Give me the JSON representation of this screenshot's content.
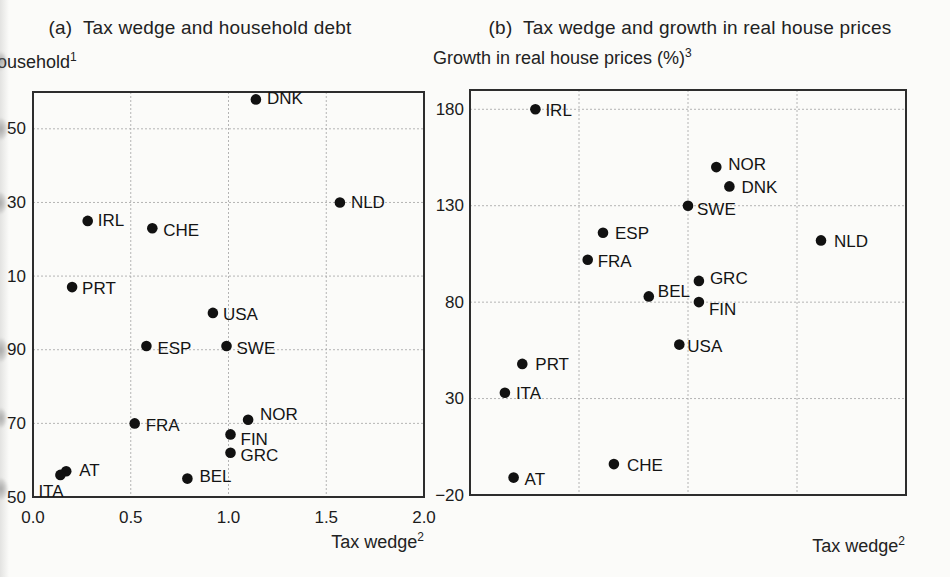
{
  "figure": {
    "background_color": "#fbfbf9",
    "ink_color": "#1c1c1c",
    "grid_color": "#a8a8a8",
    "frame_color": "#2d2d2d",
    "dot_color": "#111111"
  },
  "chart_data": [
    {
      "type": "scatter",
      "panel": "a",
      "title": "(a)  Tax wedge and household debt",
      "ylabel_text": "ousehold",
      "ylabel_sup": "1",
      "xlabel_text": "Tax wedge",
      "xlabel_sup": "2",
      "xlim": [
        0.0,
        2.0
      ],
      "ylim": [
        50,
        160
      ],
      "grid": true,
      "gridlines_x": [
        0.5,
        1.0,
        1.5
      ],
      "gridlines_y": [
        70,
        90,
        110,
        130,
        150
      ],
      "xticks": [
        {
          "value": 0.0,
          "label": "0.0"
        },
        {
          "value": 0.5,
          "label": "0.5"
        },
        {
          "value": 1.0,
          "label": "1.0"
        },
        {
          "value": 1.5,
          "label": "1.5"
        },
        {
          "value": 2.0,
          "label": "2.0"
        }
      ],
      "yticks": [
        {
          "value": 150,
          "label": "50"
        },
        {
          "value": 130,
          "label": "30"
        },
        {
          "value": 110,
          "label": "10"
        },
        {
          "value": 90,
          "label": "90"
        },
        {
          "value": 70,
          "label": "70"
        },
        {
          "value": 50,
          "label": "50"
        }
      ],
      "points": [
        {
          "label": "DNK",
          "x": 1.14,
          "y": 158
        },
        {
          "label": "NLD",
          "x": 1.57,
          "y": 130
        },
        {
          "label": "IRL",
          "x": 0.28,
          "y": 125
        },
        {
          "label": "CHE",
          "x": 0.61,
          "y": 123
        },
        {
          "label": "PRT",
          "x": 0.2,
          "y": 107
        },
        {
          "label": "USA",
          "x": 0.92,
          "y": 100
        },
        {
          "label": "ESP",
          "x": 0.58,
          "y": 91
        },
        {
          "label": "SWE",
          "x": 0.99,
          "y": 91
        },
        {
          "label": "NOR",
          "x": 1.1,
          "y": 71
        },
        {
          "label": "FRA",
          "x": 0.52,
          "y": 70
        },
        {
          "label": "FIN",
          "x": 1.01,
          "y": 67
        },
        {
          "label": "GRC",
          "x": 1.01,
          "y": 62
        },
        {
          "label": "AT",
          "x": 0.17,
          "y": 57
        },
        {
          "label": "ITA",
          "x": 0.14,
          "y": 56
        },
        {
          "label": "BEL",
          "x": 0.79,
          "y": 55
        }
      ]
    },
    {
      "type": "scatter",
      "panel": "b",
      "title": "(b)  Tax wedge and growth in real house prices",
      "ylabel_text": "Growth in real house prices (%)",
      "ylabel_sup": "3",
      "xlabel_text": "Tax wedge",
      "xlabel_sup": "2",
      "xlim": [
        0.0,
        2.0
      ],
      "ylim": [
        -20,
        190
      ],
      "grid": true,
      "gridlines_x": [
        0.5,
        1.0,
        1.5
      ],
      "gridlines_y": [
        30,
        80,
        130,
        180
      ],
      "xticks": [],
      "yticks": [
        {
          "value": 180,
          "label": "180"
        },
        {
          "value": 130,
          "label": "130"
        },
        {
          "value": 80,
          "label": "80"
        },
        {
          "value": 30,
          "label": "30"
        },
        {
          "value": -20,
          "label": "−20"
        }
      ],
      "points": [
        {
          "label": "IRL",
          "x": 0.3,
          "y": 180
        },
        {
          "label": "NOR",
          "x": 1.13,
          "y": 150
        },
        {
          "label": "DNK",
          "x": 1.19,
          "y": 140
        },
        {
          "label": "SWE",
          "x": 1.0,
          "y": 130
        },
        {
          "label": "ESP",
          "x": 0.61,
          "y": 116
        },
        {
          "label": "NLD",
          "x": 1.61,
          "y": 112
        },
        {
          "label": "FRA",
          "x": 0.54,
          "y": 102
        },
        {
          "label": "GRC",
          "x": 1.05,
          "y": 91
        },
        {
          "label": "BEL",
          "x": 0.82,
          "y": 83
        },
        {
          "label": "FIN",
          "x": 1.05,
          "y": 80
        },
        {
          "label": "USA",
          "x": 0.96,
          "y": 58
        },
        {
          "label": "PRT",
          "x": 0.24,
          "y": 48
        },
        {
          "label": "ITA",
          "x": 0.16,
          "y": 33
        },
        {
          "label": "CHE",
          "x": 0.66,
          "y": -4
        },
        {
          "label": "AT",
          "x": 0.2,
          "y": -11
        }
      ]
    }
  ]
}
